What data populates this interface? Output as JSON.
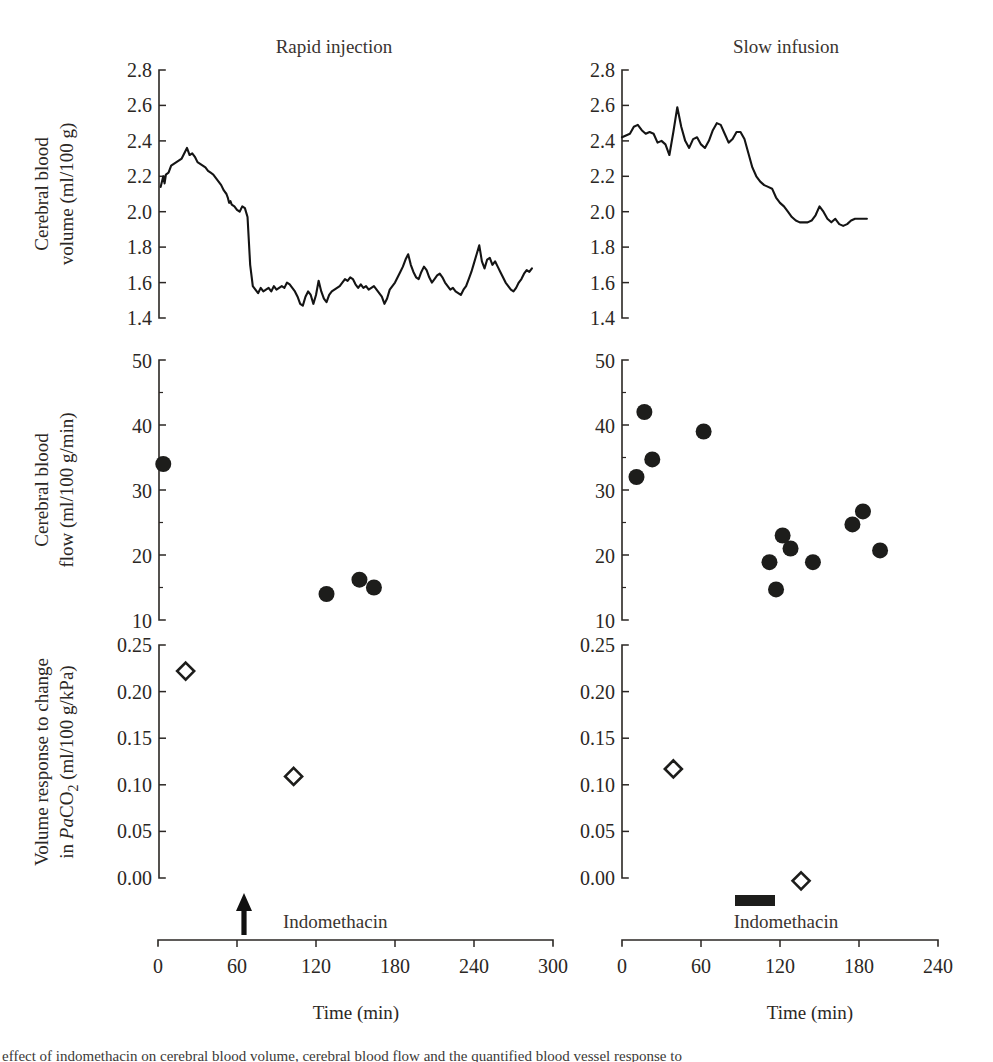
{
  "figure": {
    "panels": [
      {
        "id": "rapid",
        "title": "Rapid injection"
      },
      {
        "id": "slow",
        "title": "Slow infusion"
      }
    ],
    "x_axis_title": "Time (min)",
    "annotation_label": "Indomethacin"
  },
  "axes": {
    "cbv": {
      "ylabel_line1": "Cerebral blood",
      "ylabel_line2": "volume (ml/100 g)",
      "ticks": [
        "1.4",
        "1.6",
        "1.8",
        "2.0",
        "2.2",
        "2.4",
        "2.6",
        "2.8"
      ],
      "ylim": [
        1.4,
        2.8
      ]
    },
    "cbf": {
      "ylabel_line1": "Cerebral blood",
      "ylabel_line2": "flow (ml/100 g/min)",
      "ticks": [
        "10",
        "20",
        "30",
        "40",
        "50"
      ],
      "ylim": [
        10,
        50
      ]
    },
    "vresp": {
      "ylabel_line1": "Volume response to change",
      "ylabel_line2_pre": "in ",
      "ylabel_line2_italic": "Pa",
      "ylabel_line2_post": "CO",
      "ylabel_line2_sub": "2",
      "ylabel_line2_tail": " (ml/100 g/kPa)",
      "ticks": [
        "0.00",
        "0.05",
        "0.10",
        "0.15",
        "0.20",
        "0.25"
      ],
      "ylim": [
        0.0,
        0.25
      ]
    },
    "time_left": {
      "ticks": [
        "0",
        "60",
        "120",
        "180",
        "240",
        "300"
      ],
      "xlim": [
        0,
        300
      ]
    },
    "time_right": {
      "ticks": [
        "0",
        "60",
        "120",
        "180",
        "240"
      ],
      "xlim": [
        0,
        240
      ]
    }
  },
  "caption": {
    "cutoff_line": "effect of indomethacin on cerebral blood volume, cerebral blood flow and the quantified blood vessel response to"
  },
  "chart_data": [
    {
      "id": "cbv-rapid",
      "type": "line",
      "title": "Rapid injection",
      "xlabel": "Time (min)",
      "ylabel": "Cerebral blood volume (ml/100 g)",
      "xlim": [
        0,
        300
      ],
      "ylim": [
        1.4,
        2.8
      ],
      "grid": false,
      "annotations": [
        {
          "kind": "arrow",
          "label": "Indomethacin",
          "x": 65
        }
      ],
      "x": [
        2,
        4,
        5,
        6,
        8,
        10,
        12,
        14,
        16,
        18,
        20,
        22,
        24,
        26,
        28,
        30,
        32,
        34,
        36,
        38,
        40,
        42,
        44,
        46,
        48,
        50,
        52,
        53,
        54,
        55,
        56,
        58,
        60,
        62,
        64,
        66,
        68,
        70,
        72,
        74,
        76,
        78,
        80,
        82,
        84,
        86,
        88,
        90,
        92,
        94,
        96,
        98,
        100,
        102,
        104,
        106,
        108,
        110,
        112,
        114,
        116,
        118,
        120,
        122,
        124,
        126,
        128,
        130,
        132,
        134,
        136,
        138,
        140,
        142,
        144,
        146,
        148,
        150,
        152,
        154,
        156,
        158,
        160,
        162,
        164,
        166,
        168,
        170,
        172,
        174,
        176,
        178,
        180,
        182,
        184,
        186,
        188,
        190,
        192,
        194,
        196,
        198,
        200,
        202,
        204,
        206,
        208,
        210,
        212,
        214,
        216,
        218,
        220,
        222,
        224,
        226,
        228,
        230,
        232,
        234,
        236,
        238,
        240,
        242,
        244,
        246,
        248,
        250,
        252,
        254,
        256,
        258,
        260,
        262,
        264,
        266,
        268,
        270,
        272,
        274,
        276,
        278,
        280,
        282,
        284,
        286,
        288
      ],
      "y": [
        2.14,
        2.2,
        2.16,
        2.21,
        2.22,
        2.26,
        2.27,
        2.28,
        2.29,
        2.3,
        2.33,
        2.36,
        2.32,
        2.33,
        2.31,
        2.28,
        2.27,
        2.26,
        2.25,
        2.23,
        2.22,
        2.21,
        2.19,
        2.17,
        2.15,
        2.12,
        2.1,
        2.08,
        2.05,
        2.06,
        2.04,
        2.03,
        2.01,
        2.0,
        2.03,
        2.02,
        1.97,
        1.7,
        1.58,
        1.56,
        1.54,
        1.57,
        1.55,
        1.56,
        1.57,
        1.55,
        1.58,
        1.56,
        1.57,
        1.58,
        1.57,
        1.6,
        1.59,
        1.57,
        1.55,
        1.52,
        1.48,
        1.47,
        1.52,
        1.55,
        1.53,
        1.48,
        1.53,
        1.61,
        1.55,
        1.51,
        1.49,
        1.53,
        1.55,
        1.56,
        1.57,
        1.58,
        1.6,
        1.62,
        1.61,
        1.63,
        1.62,
        1.59,
        1.57,
        1.59,
        1.57,
        1.58,
        1.56,
        1.57,
        1.58,
        1.56,
        1.54,
        1.52,
        1.48,
        1.51,
        1.56,
        1.58,
        1.6,
        1.63,
        1.66,
        1.69,
        1.73,
        1.76,
        1.7,
        1.66,
        1.63,
        1.62,
        1.66,
        1.69,
        1.67,
        1.63,
        1.6,
        1.62,
        1.64,
        1.65,
        1.63,
        1.6,
        1.58,
        1.56,
        1.57,
        1.55,
        1.54,
        1.53,
        1.56,
        1.58,
        1.62,
        1.66,
        1.71,
        1.76,
        1.81,
        1.72,
        1.68,
        1.73,
        1.74,
        1.7,
        1.72,
        1.69,
        1.66,
        1.63,
        1.6,
        1.58,
        1.56,
        1.55,
        1.57,
        1.6,
        1.62,
        1.65,
        1.67,
        1.66,
        1.68
      ]
    },
    {
      "id": "cbv-slow",
      "type": "line",
      "title": "Slow infusion",
      "xlabel": "Time (min)",
      "ylabel": "Cerebral blood volume (ml/100 g)",
      "xlim": [
        0,
        240
      ],
      "ylim": [
        1.4,
        2.8
      ],
      "grid": false,
      "annotations": [
        {
          "kind": "bar",
          "label": "Indomethacin",
          "x_start": 96,
          "x_end": 126
        }
      ],
      "x": [
        0,
        3,
        6,
        9,
        12,
        15,
        18,
        21,
        24,
        27,
        30,
        33,
        36,
        39,
        42,
        45,
        48,
        51,
        54,
        57,
        60,
        63,
        66,
        69,
        72,
        75,
        78,
        81,
        84,
        87,
        90,
        93,
        96,
        99,
        102,
        105,
        108,
        111,
        114,
        117,
        120,
        123,
        126,
        129,
        132,
        135,
        138,
        141,
        144,
        147,
        150,
        153,
        156,
        159,
        162,
        165,
        168,
        171,
        174,
        177,
        180,
        183,
        186
      ],
      "y": [
        2.42,
        2.43,
        2.44,
        2.48,
        2.49,
        2.46,
        2.44,
        2.45,
        2.44,
        2.39,
        2.4,
        2.38,
        2.32,
        2.45,
        2.59,
        2.48,
        2.4,
        2.36,
        2.41,
        2.42,
        2.38,
        2.36,
        2.4,
        2.46,
        2.5,
        2.49,
        2.44,
        2.39,
        2.41,
        2.45,
        2.45,
        2.41,
        2.33,
        2.25,
        2.2,
        2.17,
        2.15,
        2.14,
        2.13,
        2.08,
        2.05,
        2.03,
        2.0,
        1.97,
        1.95,
        1.94,
        1.94,
        1.94,
        1.95,
        1.98,
        2.03,
        2.0,
        1.96,
        1.94,
        1.96,
        1.93,
        1.92,
        1.93,
        1.95,
        1.96,
        1.96,
        1.96,
        1.96
      ]
    },
    {
      "id": "cbf-rapid",
      "type": "scatter",
      "title": "Rapid injection",
      "xlabel": "Time (min)",
      "ylabel": "Cerebral blood flow (ml/100 g/min)",
      "xlim": [
        0,
        300
      ],
      "ylim": [
        10,
        50
      ],
      "grid": false,
      "marker": "filled-circle",
      "points": [
        {
          "x": 4,
          "y": 34
        },
        {
          "x": 128,
          "y": 14
        },
        {
          "x": 153,
          "y": 16.2
        },
        {
          "x": 164,
          "y": 15
        }
      ]
    },
    {
      "id": "cbf-slow",
      "type": "scatter",
      "title": "Slow infusion",
      "xlabel": "Time (min)",
      "ylabel": "Cerebral blood flow (ml/100 g/min)",
      "xlim": [
        0,
        240
      ],
      "ylim": [
        10,
        50
      ],
      "grid": false,
      "marker": "filled-circle",
      "points": [
        {
          "x": 11,
          "y": 32
        },
        {
          "x": 17,
          "y": 42
        },
        {
          "x": 23,
          "y": 34.7
        },
        {
          "x": 62,
          "y": 39
        },
        {
          "x": 112,
          "y": 18.9
        },
        {
          "x": 117,
          "y": 14.7
        },
        {
          "x": 122,
          "y": 23
        },
        {
          "x": 128,
          "y": 21
        },
        {
          "x": 145,
          "y": 18.9
        },
        {
          "x": 175,
          "y": 24.7
        },
        {
          "x": 183,
          "y": 26.7
        },
        {
          "x": 196,
          "y": 20.7
        }
      ]
    },
    {
      "id": "vresp-rapid",
      "type": "scatter",
      "title": "Rapid injection",
      "xlabel": "Time (min)",
      "ylabel": "Volume response to change in PaCO2 (ml/100 g/kPa)",
      "xlim": [
        0,
        300
      ],
      "ylim": [
        0.0,
        0.25
      ],
      "grid": false,
      "marker": "open-diamond",
      "points": [
        {
          "x": 21,
          "y": 0.222
        },
        {
          "x": 103,
          "y": 0.109
        }
      ]
    },
    {
      "id": "vresp-slow",
      "type": "scatter",
      "title": "Slow infusion",
      "xlabel": "Time (min)",
      "ylabel": "Volume response to change in PaCO2 (ml/100 g/kPa)",
      "xlim": [
        0,
        240
      ],
      "ylim": [
        0.0,
        0.25
      ],
      "grid": false,
      "marker": "open-diamond",
      "points": [
        {
          "x": 39,
          "y": 0.117
        },
        {
          "x": 136,
          "y": -0.003
        }
      ]
    }
  ]
}
